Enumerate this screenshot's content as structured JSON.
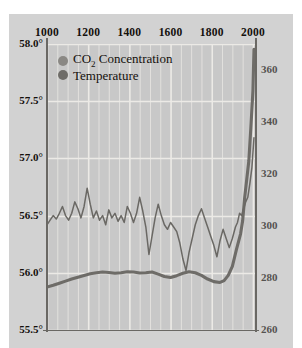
{
  "chart_data": {
    "type": "line",
    "title": "",
    "xlabel": "",
    "ylabel": "",
    "xlim": [
      1000,
      2010
    ],
    "xticks": [
      1000,
      1200,
      1400,
      1600,
      1800,
      2000
    ],
    "xtick_labels": [
      "1000",
      "1200",
      "1400",
      "1600",
      "1800",
      "2000"
    ],
    "x_minor_step": 50,
    "grid": true,
    "legend_position": "top-left",
    "left_axis": {
      "label": "Temperature (°F)",
      "ylim": [
        55.5,
        58.0
      ],
      "ticks": [
        58.0,
        57.5,
        57.0,
        56.5,
        56.0,
        55.5
      ],
      "tick_labels": [
        "58.0°",
        "57.5°",
        "57.0°",
        "56.5°",
        "56.0°",
        "55.5°"
      ],
      "color": "#14100c"
    },
    "right_axis": {
      "label": "CO2 Concentration (ppm)",
      "ylim": [
        260,
        370
      ],
      "ticks": [
        360,
        340,
        320,
        300,
        280,
        260
      ],
      "tick_labels": [
        "360",
        "340",
        "320",
        "300",
        "280",
        "260"
      ],
      "color": "#555350"
    },
    "series": [
      {
        "name": "CO2 Concentration",
        "axis": "right",
        "color": "#6e6c68",
        "linewidth": 3.1,
        "marker_color": "#8a8884",
        "x": [
          1000,
          1030,
          1060,
          1090,
          1120,
          1150,
          1180,
          1210,
          1240,
          1270,
          1300,
          1330,
          1360,
          1390,
          1420,
          1450,
          1480,
          1510,
          1540,
          1570,
          1600,
          1630,
          1660,
          1690,
          1720,
          1750,
          1780,
          1810,
          1840,
          1860,
          1880,
          1900,
          1920,
          1940,
          1950,
          1960,
          1970,
          1980,
          1990,
          2000,
          2005
        ],
        "y": [
          276.5,
          277.2,
          278.0,
          278.8,
          279.6,
          280.3,
          281.0,
          281.6,
          282.0,
          282.3,
          282.1,
          281.8,
          282.0,
          282.4,
          282.3,
          281.9,
          282.0,
          282.3,
          281.5,
          280.6,
          280.2,
          280.9,
          281.8,
          282.4,
          282.0,
          281.0,
          279.6,
          278.6,
          278.3,
          279.0,
          281.0,
          284.5,
          291.0,
          297.0,
          302.0,
          311.0,
          318.0,
          325.0,
          338.0,
          352.0,
          368.0
        ]
      },
      {
        "name": "Temperature",
        "axis": "left",
        "color": "#6a6864",
        "linewidth": 1.5,
        "marker_color": "#757370",
        "x": [
          1000,
          1015,
          1030,
          1045,
          1060,
          1075,
          1090,
          1105,
          1120,
          1135,
          1150,
          1165,
          1180,
          1195,
          1210,
          1225,
          1240,
          1255,
          1270,
          1285,
          1300,
          1315,
          1330,
          1345,
          1360,
          1375,
          1390,
          1405,
          1420,
          1435,
          1450,
          1465,
          1480,
          1495,
          1510,
          1525,
          1540,
          1555,
          1570,
          1585,
          1600,
          1615,
          1630,
          1645,
          1660,
          1675,
          1690,
          1705,
          1720,
          1735,
          1750,
          1765,
          1780,
          1795,
          1810,
          1825,
          1840,
          1855,
          1870,
          1885,
          1900,
          1915,
          1925,
          1935,
          1945,
          1955,
          1965,
          1975,
          1985,
          1995,
          2000,
          2005
        ],
        "y": [
          56.42,
          56.46,
          56.5,
          56.47,
          56.52,
          56.58,
          56.5,
          56.46,
          56.52,
          56.62,
          56.56,
          56.48,
          56.58,
          56.74,
          56.6,
          56.48,
          56.54,
          56.46,
          56.5,
          56.42,
          56.55,
          56.48,
          56.52,
          56.45,
          56.5,
          56.44,
          56.58,
          56.52,
          56.44,
          56.52,
          56.66,
          56.54,
          56.4,
          56.16,
          56.32,
          56.48,
          56.6,
          56.5,
          56.42,
          56.38,
          56.44,
          56.4,
          56.36,
          56.26,
          56.12,
          56.02,
          56.18,
          56.3,
          56.42,
          56.5,
          56.56,
          56.48,
          56.4,
          56.32,
          56.24,
          56.14,
          56.28,
          56.38,
          56.3,
          56.22,
          56.3,
          56.4,
          56.44,
          56.52,
          56.5,
          56.56,
          56.62,
          56.66,
          56.78,
          56.92,
          57.05,
          57.18
        ]
      }
    ]
  },
  "legend": {
    "items": [
      {
        "label_html": "CO<sub>2</sub> Concentration",
        "color": "#8a8884"
      },
      {
        "label_html": "Temperature",
        "color": "#6e6c68"
      }
    ]
  },
  "caption": {
    "text": ""
  },
  "colors": {
    "page_background": "#ffffff",
    "panel_background": "#d2d2d2",
    "plot_background": "#c8c8c8",
    "gridline": "#eceae6",
    "axis_line": "#6a6864",
    "left_tick_text": "#14100c",
    "right_tick_text": "#555350"
  }
}
